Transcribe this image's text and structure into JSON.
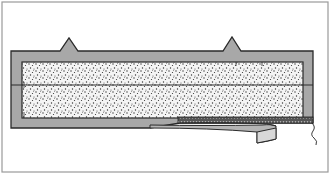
{
  "figure": {
    "type": "technical-illustration",
    "colors": {
      "background": "#ffffff",
      "border": "#9a9a9a",
      "frame_fill": "#a8a8a8",
      "outline": "#2a2a2a",
      "fill_bg": "#f4f4f4",
      "stipple": "#333333",
      "strip_fill": "#b5b5b5",
      "strip_end": "#d8d8d8"
    },
    "parts": [
      {
        "id": "outer-frame",
        "description": "gray rectangular frame with two triangular ridges on top"
      },
      {
        "id": "filler",
        "description": "stippled core material"
      },
      {
        "id": "center-line",
        "description": "horizontal line across middle of core"
      },
      {
        "id": "hatched-band",
        "description": "dark hatched band along bottom right of core"
      },
      {
        "id": "peel-strip",
        "description": "curved strip peeling away from bottom"
      },
      {
        "id": "wire",
        "description": "thin wavy wire hanging from right end"
      }
    ]
  }
}
